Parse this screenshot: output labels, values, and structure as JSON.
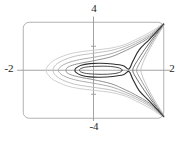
{
  "figure": {
    "axis_labels": {
      "top": "4",
      "bottom": "-4",
      "left": "-2",
      "right": "2"
    }
  },
  "colors": {
    "background": "#ffffff",
    "frame": "#b3b3b3",
    "axis": "#999999",
    "label_text": "#1d1d1d",
    "separatrix": "#2e2e2e"
  },
  "chart_data": {
    "type": "line",
    "title": "",
    "xlabel": "",
    "ylabel": "",
    "x_range": [
      -2,
      2
    ],
    "y_range": [
      -4,
      4
    ],
    "x_tick_labels": [
      "-2",
      "2"
    ],
    "y_tick_labels": [
      "4",
      "-4"
    ],
    "unlabeled_y_ticks": [
      2,
      -2
    ],
    "grid": false,
    "legend_position": "none",
    "frame_style": "rounded-rectangle",
    "series": [
      {
        "name": "outer-curve-1",
        "color": "#c9c9c9",
        "width": 0.9,
        "closed": false,
        "points": [
          [
            2.0,
            3.92
          ],
          [
            1.6,
            3.15
          ],
          [
            1.2,
            2.55
          ],
          [
            0.9,
            2.15
          ],
          [
            0.5,
            1.85
          ],
          [
            0.0,
            1.67
          ],
          [
            -0.5,
            1.48
          ],
          [
            -0.85,
            1.2
          ],
          [
            -1.15,
            0.78
          ],
          [
            -1.3,
            0.35
          ],
          [
            -1.35,
            0.0
          ],
          [
            -1.3,
            -0.35
          ],
          [
            -1.15,
            -0.78
          ],
          [
            -0.85,
            -1.2
          ],
          [
            -0.5,
            -1.48
          ],
          [
            0.0,
            -1.67
          ],
          [
            0.5,
            -1.85
          ],
          [
            0.9,
            -2.15
          ],
          [
            1.2,
            -2.55
          ],
          [
            1.6,
            -3.15
          ],
          [
            2.0,
            -3.92
          ]
        ]
      },
      {
        "name": "outer-curve-2",
        "color": "#b9b9b9",
        "width": 0.9,
        "closed": false,
        "points": [
          [
            2.0,
            3.9
          ],
          [
            1.6,
            3.0
          ],
          [
            1.2,
            2.38
          ],
          [
            0.9,
            2.0
          ],
          [
            0.5,
            1.65
          ],
          [
            0.0,
            1.42
          ],
          [
            -0.45,
            1.22
          ],
          [
            -0.75,
            0.97
          ],
          [
            -1.0,
            0.62
          ],
          [
            -1.12,
            0.28
          ],
          [
            -1.15,
            0.0
          ],
          [
            -1.12,
            -0.28
          ],
          [
            -1.0,
            -0.62
          ],
          [
            -0.75,
            -0.97
          ],
          [
            -0.45,
            -1.22
          ],
          [
            0.0,
            -1.42
          ],
          [
            0.5,
            -1.65
          ],
          [
            0.9,
            -2.0
          ],
          [
            1.2,
            -2.38
          ],
          [
            1.6,
            -3.0
          ],
          [
            2.0,
            -3.9
          ]
        ]
      },
      {
        "name": "outer-curve-3",
        "color": "#a3a3a3",
        "width": 0.9,
        "closed": false,
        "points": [
          [
            2.0,
            3.88
          ],
          [
            1.6,
            2.88
          ],
          [
            1.2,
            2.22
          ],
          [
            0.9,
            1.82
          ],
          [
            0.5,
            1.38
          ],
          [
            0.0,
            1.08
          ],
          [
            -0.4,
            0.88
          ],
          [
            -0.7,
            0.65
          ],
          [
            -0.9,
            0.38
          ],
          [
            -0.98,
            0.15
          ],
          [
            -1.0,
            0.0
          ],
          [
            -0.98,
            -0.15
          ],
          [
            -0.9,
            -0.38
          ],
          [
            -0.7,
            -0.65
          ],
          [
            -0.4,
            -0.88
          ],
          [
            0.0,
            -1.08
          ],
          [
            0.5,
            -1.38
          ],
          [
            0.9,
            -1.82
          ],
          [
            1.2,
            -2.22
          ],
          [
            1.6,
            -2.88
          ],
          [
            2.0,
            -3.88
          ]
        ]
      },
      {
        "name": "outer-curve-4",
        "color": "#878787",
        "width": 0.9,
        "closed": false,
        "points": [
          [
            2.0,
            3.86
          ],
          [
            1.6,
            2.76
          ],
          [
            1.2,
            2.06
          ],
          [
            0.9,
            1.62
          ],
          [
            0.5,
            1.12
          ],
          [
            0.0,
            0.79
          ],
          [
            -0.35,
            0.6
          ],
          [
            -0.6,
            0.42
          ],
          [
            -0.75,
            0.22
          ],
          [
            -0.78,
            0.0
          ],
          [
            -0.75,
            -0.22
          ],
          [
            -0.6,
            -0.42
          ],
          [
            -0.35,
            -0.6
          ],
          [
            0.0,
            -0.79
          ],
          [
            0.5,
            -1.12
          ],
          [
            0.9,
            -1.62
          ],
          [
            1.2,
            -2.06
          ],
          [
            1.6,
            -2.76
          ],
          [
            2.0,
            -3.86
          ]
        ]
      },
      {
        "name": "separatrix-homoclinic-loop",
        "color": "#2e2e2e",
        "width": 1.15,
        "closed": false,
        "points": [
          [
            2.0,
            3.84
          ],
          [
            1.6,
            2.6
          ],
          [
            1.3,
            1.7
          ],
          [
            1.12,
            0.75
          ],
          [
            1.01,
            0.1
          ],
          [
            0.85,
            0.38
          ],
          [
            0.55,
            0.52
          ],
          [
            0.2,
            0.58
          ],
          [
            -0.1,
            0.55
          ],
          [
            -0.35,
            0.42
          ],
          [
            -0.5,
            0.18
          ],
          [
            -0.53,
            0.0
          ],
          [
            -0.5,
            -0.18
          ],
          [
            -0.35,
            -0.42
          ],
          [
            -0.1,
            -0.55
          ],
          [
            0.2,
            -0.58
          ],
          [
            0.55,
            -0.52
          ],
          [
            0.85,
            -0.38
          ],
          [
            1.01,
            -0.1
          ],
          [
            1.12,
            -0.75
          ],
          [
            1.3,
            -1.7
          ],
          [
            1.6,
            -2.6
          ],
          [
            2.0,
            -3.84
          ]
        ]
      },
      {
        "name": "inner-closed-orbit",
        "color": "#4d4d4d",
        "width": 1.0,
        "closed": true,
        "points": [
          [
            0.82,
            0.0
          ],
          [
            0.7,
            0.22
          ],
          [
            0.4,
            0.33
          ],
          [
            0.1,
            0.33
          ],
          [
            -0.2,
            0.27
          ],
          [
            -0.36,
            0.14
          ],
          [
            -0.4,
            0.0
          ],
          [
            -0.36,
            -0.14
          ],
          [
            -0.2,
            -0.27
          ],
          [
            0.1,
            -0.33
          ],
          [
            0.4,
            -0.33
          ],
          [
            0.7,
            -0.22
          ]
        ]
      },
      {
        "name": "right-branch-1",
        "color": "#5a5a5a",
        "width": 0.9,
        "closed": false,
        "points": [
          [
            2.0,
            3.8
          ],
          [
            1.7,
            2.7
          ],
          [
            1.45,
            1.7
          ],
          [
            1.25,
            0.8
          ],
          [
            1.14,
            0.25
          ],
          [
            1.12,
            0.0
          ],
          [
            1.14,
            -0.25
          ],
          [
            1.25,
            -0.8
          ],
          [
            1.45,
            -1.7
          ],
          [
            1.7,
            -2.7
          ],
          [
            2.0,
            -3.8
          ]
        ]
      },
      {
        "name": "right-branch-2",
        "color": "#909090",
        "width": 0.9,
        "closed": false,
        "points": [
          [
            2.0,
            3.76
          ],
          [
            1.75,
            2.75
          ],
          [
            1.55,
            1.8
          ],
          [
            1.35,
            0.8
          ],
          [
            1.25,
            0.25
          ],
          [
            1.23,
            0.0
          ],
          [
            1.25,
            -0.25
          ],
          [
            1.35,
            -0.8
          ],
          [
            1.55,
            -1.8
          ],
          [
            1.75,
            -2.75
          ],
          [
            2.0,
            -3.76
          ]
        ]
      },
      {
        "name": "right-branch-3",
        "color": "#bcbcbc",
        "width": 0.9,
        "closed": false,
        "points": [
          [
            2.0,
            3.72
          ],
          [
            1.8,
            2.8
          ],
          [
            1.62,
            1.9
          ],
          [
            1.45,
            0.9
          ],
          [
            1.37,
            0.3
          ],
          [
            1.35,
            0.0
          ],
          [
            1.37,
            -0.3
          ],
          [
            1.45,
            -0.9
          ],
          [
            1.62,
            -1.9
          ],
          [
            1.8,
            -2.8
          ],
          [
            2.0,
            -3.72
          ]
        ]
      }
    ]
  }
}
